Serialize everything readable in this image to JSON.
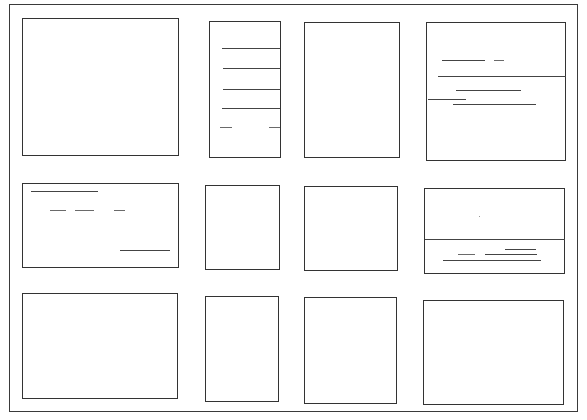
{
  "sketch": {
    "title": "",
    "description": "Hand-drawn wireframe storyboard: 3 rows x 4 columns of panels with placeholder strokes",
    "frame": {
      "x": 9,
      "y": 4,
      "w": 569,
      "h": 408
    },
    "colors": {
      "ink": "#333333",
      "paper": "#ffffff"
    },
    "panels": [
      {
        "id": "r1c1",
        "x": 22,
        "y": 18,
        "w": 157,
        "h": 138,
        "strokes": []
      },
      {
        "id": "r1c2",
        "x": 209,
        "y": 21,
        "w": 72,
        "h": 137,
        "strokes": [
          {
            "x": 222,
            "y": 48,
            "w": 58
          },
          {
            "x": 223,
            "y": 68,
            "w": 57
          },
          {
            "x": 223,
            "y": 89,
            "w": 57
          },
          {
            "x": 222,
            "y": 108,
            "w": 58
          },
          {
            "x": 220,
            "y": 127,
            "w": 12
          },
          {
            "x": 269,
            "y": 127,
            "w": 11
          }
        ]
      },
      {
        "id": "r1c3",
        "x": 304,
        "y": 22,
        "w": 96,
        "h": 136,
        "strokes": []
      },
      {
        "id": "r1c4",
        "x": 426,
        "y": 22,
        "w": 140,
        "h": 139,
        "strokes": [
          {
            "x": 442,
            "y": 60,
            "w": 43
          },
          {
            "x": 494,
            "y": 60,
            "w": 10
          },
          {
            "x": 438,
            "y": 76,
            "w": 128
          },
          {
            "x": 456,
            "y": 90,
            "w": 65
          },
          {
            "x": 428,
            "y": 99,
            "w": 38
          },
          {
            "x": 453,
            "y": 104,
            "w": 83
          }
        ]
      },
      {
        "id": "r2c1",
        "x": 22,
        "y": 183,
        "w": 157,
        "h": 85,
        "strokes": [
          {
            "x": 31,
            "y": 191,
            "w": 67
          },
          {
            "x": 50,
            "y": 210,
            "w": 16
          },
          {
            "x": 75,
            "y": 210,
            "w": 19
          },
          {
            "x": 114,
            "y": 210,
            "w": 11
          },
          {
            "x": 120,
            "y": 250,
            "w": 50
          }
        ]
      },
      {
        "id": "r2c2",
        "x": 205,
        "y": 185,
        "w": 75,
        "h": 85,
        "strokes": []
      },
      {
        "id": "r2c3",
        "x": 304,
        "y": 186,
        "w": 94,
        "h": 85,
        "strokes": []
      },
      {
        "id": "r2c4",
        "x": 424,
        "y": 188,
        "w": 141,
        "h": 86,
        "strokes": [
          {
            "x": 425,
            "y": 239,
            "w": 140
          },
          {
            "x": 505,
            "y": 249,
            "w": 31
          },
          {
            "x": 458,
            "y": 254,
            "w": 17
          },
          {
            "x": 485,
            "y": 254,
            "w": 52
          },
          {
            "x": 443,
            "y": 260,
            "w": 98
          }
        ],
        "dots": [
          {
            "x": 479,
            "y": 216
          }
        ]
      },
      {
        "id": "r3c1",
        "x": 22,
        "y": 293,
        "w": 156,
        "h": 106,
        "strokes": []
      },
      {
        "id": "r3c2",
        "x": 205,
        "y": 296,
        "w": 74,
        "h": 106,
        "strokes": []
      },
      {
        "id": "r3c3",
        "x": 304,
        "y": 297,
        "w": 93,
        "h": 107,
        "strokes": []
      },
      {
        "id": "r3c4",
        "x": 423,
        "y": 300,
        "w": 141,
        "h": 105,
        "strokes": []
      }
    ]
  }
}
